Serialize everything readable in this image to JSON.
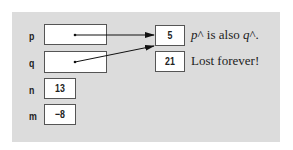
{
  "diagram": {
    "pointers": [
      {
        "name": "p",
        "target": 0
      },
      {
        "name": "q",
        "target": 0
      }
    ],
    "variables": [
      {
        "name": "n",
        "value": "13"
      },
      {
        "name": "m",
        "value": "−8"
      }
    ],
    "heap": [
      {
        "value": "5",
        "note_var1": "p",
        "note_mid": "^ is also ",
        "note_var2": "q",
        "note_end": "^."
      },
      {
        "value": "21",
        "note": "Lost forever!"
      }
    ],
    "colors": {
      "panel": "#dcdcdc",
      "box": "#ffffff",
      "border": "#555555",
      "arrow": "#111111"
    }
  }
}
